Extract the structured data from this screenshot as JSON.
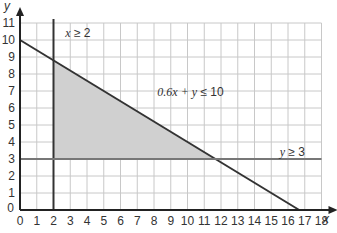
{
  "chart_data": {
    "type": "line",
    "title": "",
    "xlabel": "x",
    "ylabel": "y",
    "xlim": [
      0,
      18
    ],
    "ylim": [
      0,
      11
    ],
    "grid": true,
    "x_ticks": [
      "0",
      "1",
      "2",
      "3",
      "4",
      "5",
      "6",
      "7",
      "8",
      "9",
      "10",
      "11",
      "12",
      "13",
      "14",
      "15",
      "16",
      "17",
      "18"
    ],
    "y_ticks": [
      "0",
      "1",
      "2",
      "3",
      "4",
      "5",
      "6",
      "7",
      "8",
      "9",
      "10",
      "11"
    ],
    "series": [
      {
        "name": "x ≥ 2",
        "kind": "vertical",
        "x": 2,
        "color": "#333333"
      },
      {
        "name": "0.6x + y ≤ 10",
        "kind": "line",
        "points": [
          [
            0,
            10
          ],
          [
            16.67,
            0
          ]
        ],
        "color": "#333333"
      },
      {
        "name": "y ≥ 3",
        "kind": "horizontal",
        "y": 3,
        "color": "#777777"
      }
    ],
    "shaded_region": {
      "description": "feasible region",
      "vertices": [
        [
          2,
          3
        ],
        [
          2,
          8.8
        ],
        [
          11.67,
          3
        ]
      ],
      "color": "#d0d0d0"
    },
    "annotations": [
      {
        "text_var": "x",
        "text_rest": " ≥ 2",
        "x": 2.7,
        "y": 10.2
      },
      {
        "text_var": "0.6x + y",
        "text_rest": " ≤ 10",
        "x": 8.2,
        "y": 6.7
      },
      {
        "text_var": "y",
        "text_rest": " ≥ 3",
        "x": 15.5,
        "y": 3.2
      }
    ]
  },
  "labels": {
    "x_axis": "x",
    "y_axis": "y",
    "ann_x2": "x ≥ 2",
    "ann_line": "0.6x + y ≤ 10",
    "ann_y3": "y ≥ 3"
  }
}
